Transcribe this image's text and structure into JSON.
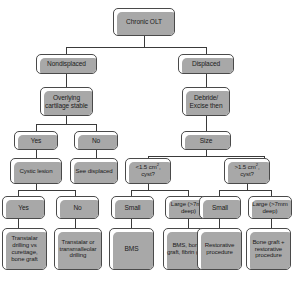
{
  "diagram": {
    "type": "flowchart",
    "colors": {
      "box_fill": "#ffffff",
      "box_border": "#4a4a4a",
      "shadow": "#a8a8a8",
      "connector": "#3a3a3a",
      "text": "#1c1c1c",
      "background": "#ffffff"
    },
    "nodes": {
      "root": "Chronic OLT",
      "nondisplaced": "Nondisplaced",
      "displaced": "Displaced",
      "overlying_cartilage_stable": "Overlying cartilage stable",
      "debride_excise_then": "Debride/ Excise then",
      "yes_l1": "Yes",
      "no_l1": "No",
      "size": "Size",
      "cystic_lesion": "Cystic lesion",
      "see_displaced": "See displaced",
      "cyst_small_q": "<1.5 cm2 cyst?",
      "cyst_small_q_pre": "<1.5 cm",
      "cyst_small_q_sup": "2",
      "cyst_small_q_post": ", cyst?",
      "cyst_large_q_pre": ">1.5 cm",
      "cyst_large_q_sup": "2",
      "cyst_large_q_post": ", cyst?",
      "yes_l2": "Yes",
      "no_l2": "No",
      "small_a": "Small",
      "large_a": "Large (>7mm deep)",
      "small_b": "Small",
      "large_b": "Large (>7mm deep)",
      "tx_transtalar_curettage": "Transtalar drilling vs curettage, bone graft",
      "tx_transtalar_transmalleolar": "Transtalar or transmalleolar drilling",
      "tx_bms": "BMS",
      "tx_bms_bonegraft_fibrin": "BMS, bone graft, fibrin glue",
      "tx_restorative": "Restorative procedure",
      "tx_bonegraft_restorative": "Bone graft + restorative procedure"
    }
  }
}
